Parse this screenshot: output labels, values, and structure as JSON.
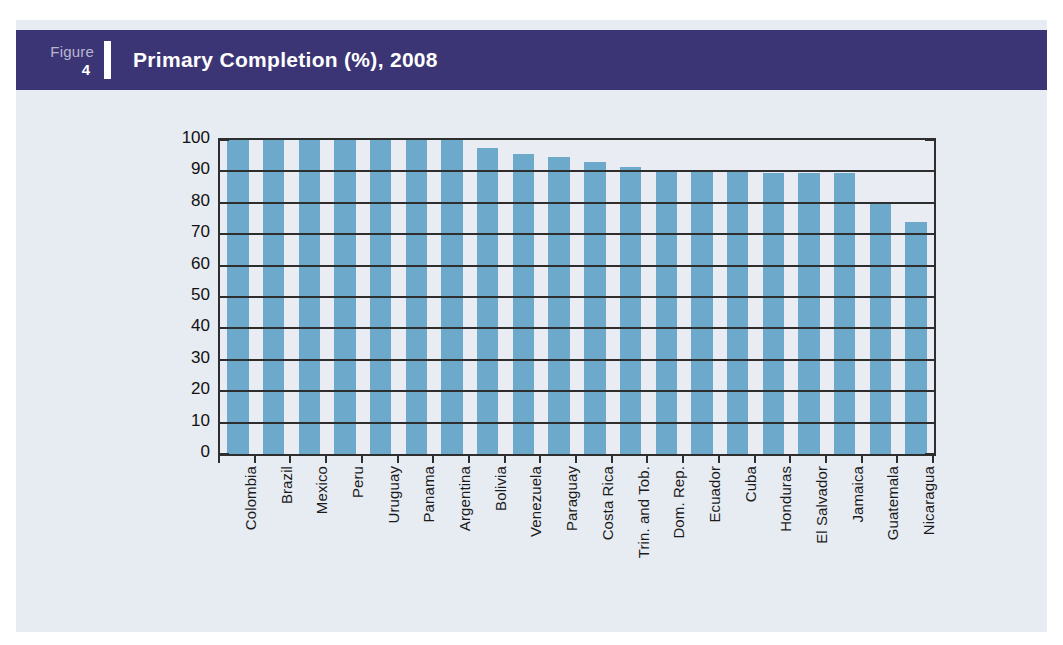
{
  "figure": {
    "label_word": "Figure",
    "number": "4",
    "title": "Primary Completion (%), 2008"
  },
  "colors": {
    "banner_background": "#3b3576",
    "banner_text": "#ffffff",
    "banner_number_label": "#b9b6cf",
    "page_background": "#e7ebf2",
    "bar_fill": "#6ca9cb",
    "axis_line": "#2e2e2e",
    "tick_text": "#111111"
  },
  "chart_data": {
    "type": "bar",
    "title": "Primary Completion (%), 2008",
    "xlabel": "",
    "ylabel": "Percent",
    "ylim": [
      0,
      100
    ],
    "ytick_step": 10,
    "yticks": [
      0,
      10,
      20,
      30,
      40,
      50,
      60,
      70,
      80,
      90,
      100
    ],
    "ytick_labels": [
      "0",
      "10",
      "20",
      "30",
      "40",
      "50",
      "60",
      "70",
      "80",
      "90",
      "100"
    ],
    "grid": true,
    "legend": false,
    "legend_position": "none",
    "orientation": "vertical",
    "categories": [
      "Colombia",
      "Brazil",
      "Mexico",
      "Peru",
      "Uruguay",
      "Panama",
      "Argentina",
      "Bolivia",
      "Venezuela",
      "Paraguay",
      "Costa Rica",
      "Trin. and Tob.",
      "Dom. Rep.",
      "Ecuador",
      "Cuba",
      "Honduras",
      "El Salvador",
      "Jamaica",
      "Guatemala",
      "Nicaragua"
    ],
    "values": [
      100,
      100,
      100,
      100,
      100,
      100,
      100,
      97.5,
      95.5,
      94.5,
      93,
      91.5,
      90.5,
      90,
      90,
      89.5,
      89.5,
      89.5,
      79.5,
      74
    ]
  }
}
